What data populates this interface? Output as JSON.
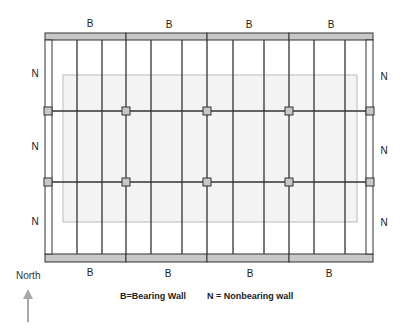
{
  "diagram": {
    "top_labels": [
      "B",
      "B",
      "B",
      "B"
    ],
    "bottom_labels": [
      "B",
      "B",
      "B",
      "B"
    ],
    "left_labels": [
      "N",
      "N",
      "N"
    ],
    "right_labels": [
      "N",
      "N",
      "N"
    ],
    "legend": {
      "bearing": "B=Bearing Wall",
      "nonbearing": "N = Nonbearing wall"
    },
    "compass": {
      "label": "North",
      "icon": "up-arrow-icon"
    },
    "colors": {
      "beam_fill": "#c8c8c8",
      "line": "#333333",
      "overlay_border": "#bbbbbb",
      "overlay_fill": "#f4f4f4",
      "arrow": "#a8a8a8"
    },
    "joist_x": [
      77,
      102,
      151,
      182,
      233,
      264,
      314,
      345
    ],
    "post_x": [
      48,
      126,
      207,
      288,
      370
    ],
    "beam_y": [
      111,
      182
    ],
    "beam_segments_x": [
      45,
      126,
      207,
      289,
      373
    ]
  }
}
